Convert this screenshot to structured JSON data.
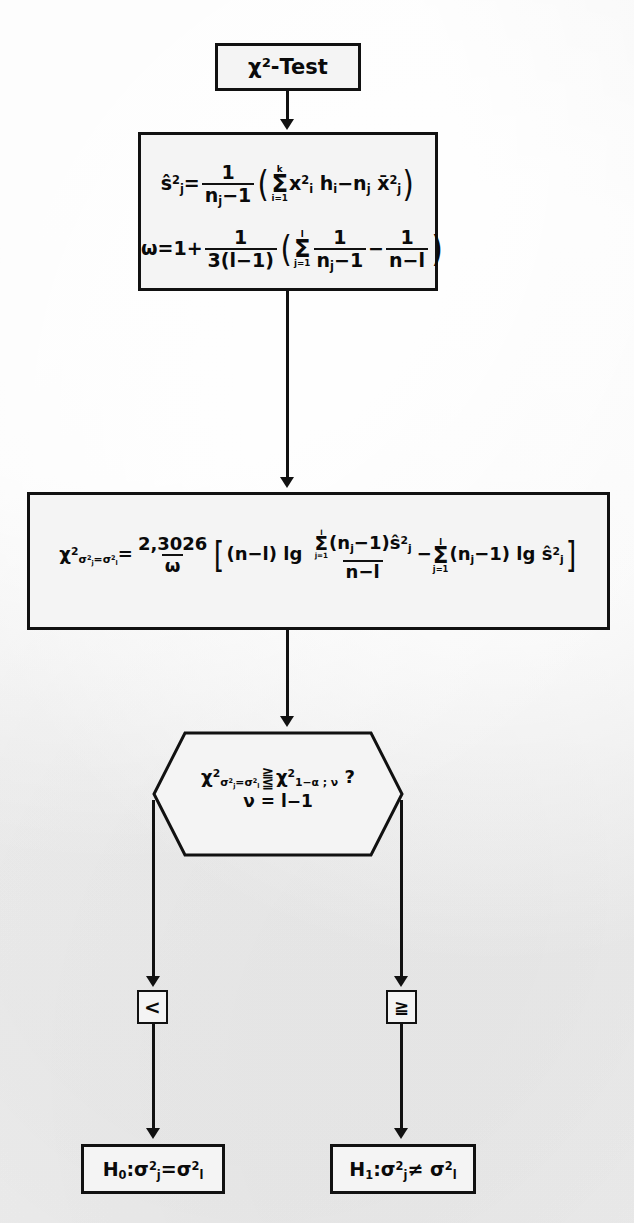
{
  "diagram": {
    "title": "χ²-Test",
    "background_color": "#f1f1f1",
    "line_color": "#111111",
    "nodes": {
      "title_box": {
        "label": "χ²-Test"
      },
      "compute_box": {
        "formula_1_plain": "ŝ²ⱼ = 1/(nⱼ-1) ( Σ(i=1..k) x²ᵢ hᵢ - nⱼ x̄²ⱼ )",
        "formula_1": {
          "lhs_base": "ŝ",
          "lhs_sup": "2",
          "lhs_sub": "j",
          "eq": "=",
          "frac_num": "1",
          "frac_den_base": "n",
          "frac_den_sub": "j",
          "frac_den_rest": "−1",
          "open_paren": "(",
          "sum_upper": "k",
          "sum_sign": "Σ",
          "sum_lower": "i=1",
          "term1_base": "x",
          "term1_sup": "2",
          "term1_sub": "i",
          "term2_base": "h",
          "term2_sub": "i",
          "minus": "−",
          "term3_base": "n",
          "term3_sub": "j",
          "term4_base": "x̄",
          "term4_sup": "2",
          "term4_sub": "j",
          "close_paren": ")"
        },
        "formula_2_plain": "ω = 1 + 1/(3(l-1)) ( Σ(j=1..l) 1/(nⱼ-1) - 1/(n-l) )",
        "formula_2": {
          "lhs": "ω",
          "eq": "=",
          "one": "1",
          "plus": "+",
          "frac_num": "1",
          "frac_den": "3(l−1)",
          "open_paren": "(",
          "sum_upper": "l",
          "sum_sign": "Σ",
          "sum_lower": "j=1",
          "frac2_num": "1",
          "frac2_den_base": "n",
          "frac2_den_sub": "j",
          "frac2_den_rest": "−1",
          "minus": "−",
          "frac3_num": "1",
          "frac3_den": "n−l",
          "close_paren": ")"
        }
      },
      "test_statistic_box": {
        "formula_plain": "χ²_{σ²j=σ²l} = 2,3026/ω [ (n-l) lg ( Σ(j=1..l)(nj-1)ŝ²j / (n-l) ) - Σ(j=1..l)(nj-1) lg ŝ²j ]",
        "formula": {
          "lhs_base": "χ",
          "lhs_sup": "2",
          "lhs_sub_a": "σ",
          "lhs_sub_a_sup": "2",
          "lhs_sub_a_sub": "j",
          "lhs_sub_eq": "=",
          "lhs_sub_b": "σ",
          "lhs_sub_b_sup": "2",
          "lhs_sub_b_sub": "l",
          "eq": "=",
          "const_num": "2,3026",
          "const_den": "ω",
          "open_bracket": "[",
          "nl_term": "(n−l)",
          "lg1": "lg",
          "inner_sum_upper": "l",
          "inner_sum_sign": "Σ",
          "inner_sum_lower": "j=1",
          "inner_term": "(n",
          "inner_term_sub": "j",
          "inner_term_rest": "−1)",
          "shat_base": "ŝ",
          "shat_sup": "2",
          "shat_sub": "j",
          "inner_den": "n−l",
          "minus": "−",
          "sum2_upper": "l",
          "sum2_sign": "Σ",
          "sum2_lower": "j=1",
          "sum2_term": "(n",
          "sum2_term_sub": "j",
          "sum2_term_rest": "−1)",
          "lg2": "lg",
          "shat2_base": "ŝ",
          "shat2_sup": "2",
          "shat2_sub": "j",
          "close_bracket": "]"
        }
      },
      "decision_hexagon": {
        "line1_plain": "χ²_{σ²j=σ²l} ≷ χ²_{1-α;ν} ?",
        "line2": "ν = l−1",
        "parts": {
          "lhs_base": "χ",
          "lhs_sup": "2",
          "lhs_sub_a": "σ",
          "lhs_sub_a_sup": "2",
          "lhs_sub_a_sub": "j",
          "lhs_sub_eq": "=",
          "lhs_sub_b": "σ",
          "lhs_sub_b_sup": "2",
          "lhs_sub_b_sub": "l",
          "rel_top": "≧",
          "rel_bottom": "≦",
          "rhs_base": "χ",
          "rhs_sup": "2",
          "rhs_sub": "1−α ; ν",
          "question": "?"
        }
      },
      "branch_less": {
        "label": "<"
      },
      "branch_greater_equal": {
        "label": "≧"
      },
      "result_h0": {
        "text_plain": "H₀: σ²j = σ²l",
        "parts": {
          "h": "H",
          "h_sub": "0",
          "colon": ":",
          "s1": "σ",
          "s1_sup": "2",
          "s1_sub": "j",
          "rel": "=",
          "s2": "σ",
          "s2_sup": "2",
          "s2_sub": "l"
        }
      },
      "result_h1": {
        "text_plain": "H₁: σ²j ≠ σ²l",
        "parts": {
          "h": "H",
          "h_sub": "1",
          "colon": ":",
          "s1": "σ",
          "s1_sup": "2",
          "s1_sub": "j",
          "rel": "≠",
          "s2": "σ",
          "s2_sup": "2",
          "s2_sub": "l"
        }
      }
    },
    "edges": [
      {
        "from": "title_box",
        "to": "compute_box",
        "label": ""
      },
      {
        "from": "compute_box",
        "to": "test_statistic_box",
        "label": ""
      },
      {
        "from": "test_statistic_box",
        "to": "decision_hexagon",
        "label": ""
      },
      {
        "from": "decision_hexagon",
        "to": "branch_less",
        "label": "<"
      },
      {
        "from": "decision_hexagon",
        "to": "branch_greater_equal",
        "label": "≧"
      },
      {
        "from": "branch_less",
        "to": "result_h0",
        "label": ""
      },
      {
        "from": "branch_greater_equal",
        "to": "result_h1",
        "label": ""
      }
    ]
  }
}
